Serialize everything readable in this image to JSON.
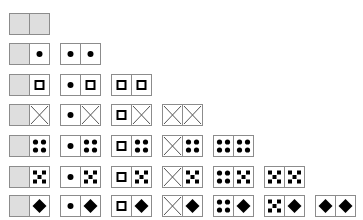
{
  "colors": {
    "border": "#8c8c8c",
    "blank_fill": "#dedede",
    "glyph": "#000000",
    "cross_line": "#555555"
  },
  "symbols_order": [
    "blank",
    "dot",
    "square",
    "cross",
    "four-dots",
    "five-dots",
    "diamond"
  ],
  "rows": [
    {
      "tiles": [
        [
          "blank",
          "blank"
        ]
      ]
    },
    {
      "tiles": [
        [
          "blank",
          "dot"
        ],
        [
          "dot",
          "dot"
        ]
      ]
    },
    {
      "tiles": [
        [
          "blank",
          "square"
        ],
        [
          "dot",
          "square"
        ],
        [
          "square",
          "square"
        ]
      ]
    },
    {
      "tiles": [
        [
          "blank",
          "cross"
        ],
        [
          "dot",
          "cross"
        ],
        [
          "square",
          "cross"
        ],
        [
          "cross",
          "cross"
        ]
      ]
    },
    {
      "tiles": [
        [
          "blank",
          "four-dots"
        ],
        [
          "dot",
          "four-dots"
        ],
        [
          "square",
          "four-dots"
        ],
        [
          "cross",
          "four-dots"
        ],
        [
          "four-dots",
          "four-dots"
        ]
      ]
    },
    {
      "tiles": [
        [
          "blank",
          "five-dots"
        ],
        [
          "dot",
          "five-dots"
        ],
        [
          "square",
          "five-dots"
        ],
        [
          "cross",
          "five-dots"
        ],
        [
          "four-dots",
          "five-dots"
        ],
        [
          "five-dots",
          "five-dots"
        ]
      ]
    },
    {
      "tiles": [
        [
          "blank",
          "diamond"
        ],
        [
          "dot",
          "diamond"
        ],
        [
          "square",
          "diamond"
        ],
        [
          "cross",
          "diamond"
        ],
        [
          "four-dots",
          "diamond"
        ],
        [
          "five-dots",
          "diamond"
        ],
        [
          "diamond",
          "diamond"
        ]
      ]
    }
  ],
  "layout": {
    "col_x": [
      9,
      60,
      111,
      162,
      213,
      264,
      315
    ],
    "row_y": [
      13,
      43,
      74,
      104,
      135,
      166,
      195
    ]
  }
}
